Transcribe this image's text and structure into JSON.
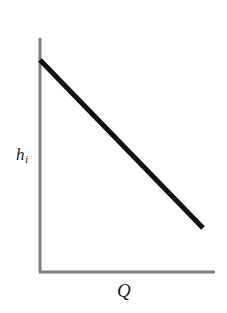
{
  "figure": {
    "background_color": "#ffffff",
    "width": 227,
    "height": 313
  },
  "axes": {
    "color": "#7d7d7d",
    "stroke_width": 3,
    "origin": {
      "x": 40,
      "y": 272
    },
    "y_axis_top": {
      "x": 40,
      "y": 38
    },
    "x_axis_right": {
      "x": 215,
      "y": 272
    },
    "y_label": "h",
    "y_label_subscript": "i",
    "x_label": "Q"
  },
  "chart_data": {
    "type": "line",
    "title": "",
    "subtitle": "",
    "xlabel": "Q",
    "ylabel": "h_i",
    "grid": false,
    "legend": null,
    "annotations": [],
    "axis_ticks": {
      "x": [],
      "y": []
    },
    "xlim": [
      0,
      1
    ],
    "ylim": [
      0,
      1
    ],
    "series": [
      {
        "name": "h_i vs Q",
        "color": "#111111",
        "line_width": 5,
        "x": [
          0.0,
          0.25,
          0.5,
          0.75,
          1.0
        ],
        "y": [
          0.906,
          0.805,
          0.705,
          0.604,
          0.504
        ],
        "pixel_points": [
          {
            "x": 40,
            "y": 60
          },
          {
            "x": 81,
            "y": 102
          },
          {
            "x": 121,
            "y": 144
          },
          {
            "x": 162,
            "y": 186
          },
          {
            "x": 203,
            "y": 228
          }
        ],
        "description": "Straight decreasing line from upper left at the vertical axis down to the lower right"
      }
    ]
  }
}
